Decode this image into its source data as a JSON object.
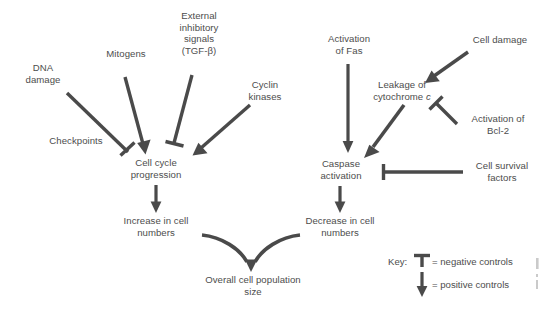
{
  "diagram": {
    "nodes": [
      {
        "id": "dna-damage",
        "label": "DNA\ndamage"
      },
      {
        "id": "mitogens",
        "label": "Mitogens"
      },
      {
        "id": "external-inhibitory",
        "label": "External\ninhibitory\nsignals\n(TGF-β)"
      },
      {
        "id": "cyclin-kinases",
        "label": "Cyclin\nkinases"
      },
      {
        "id": "checkpoints",
        "label": "Checkpoints"
      },
      {
        "id": "cell-cycle-progression",
        "label": "Cell cycle\nprogression"
      },
      {
        "id": "increase-in-cell-numbers",
        "label": "Increase in cell\nnumbers"
      },
      {
        "id": "overall-cell-population-size",
        "label": "Overall cell population\nsize"
      },
      {
        "id": "activation-of-fas",
        "label": "Activation\nof Fas"
      },
      {
        "id": "cell-damage",
        "label": "Cell damage"
      },
      {
        "id": "leakage-of-cytochrome-c",
        "label": "Leakage of\ncytochrome "
      },
      {
        "id": "leakage-cytochrome-italic",
        "label": "c"
      },
      {
        "id": "activation-of-bcl2",
        "label": "Activation of\nBcl-2"
      },
      {
        "id": "caspase-activation",
        "label": "Caspase\nactivation"
      },
      {
        "id": "cell-survival-factors",
        "label": "Cell survival\nfactors"
      },
      {
        "id": "decrease-in-cell-numbers",
        "label": "Decrease in cell\nnumbers"
      }
    ],
    "edges": [
      {
        "id": "dna-damage-to-cell-cycle",
        "from": "dna-damage",
        "to": "cell-cycle-progression",
        "type": "negative"
      },
      {
        "id": "mitogens-to-cell-cycle",
        "from": "mitogens",
        "to": "cell-cycle-progression",
        "type": "positive"
      },
      {
        "id": "tgfbeta-to-cell-cycle",
        "from": "external-inhibitory",
        "to": "cell-cycle-progression",
        "type": "negative"
      },
      {
        "id": "cyclin-kinases-to-cell-cycle",
        "from": "cyclin-kinases",
        "to": "cell-cycle-progression",
        "type": "positive"
      },
      {
        "id": "cell-cycle-to-increase",
        "from": "cell-cycle-progression",
        "to": "increase-in-cell-numbers",
        "type": "positive"
      },
      {
        "id": "increase-to-overall",
        "from": "increase-in-cell-numbers",
        "to": "overall-cell-population-size",
        "type": "positive"
      },
      {
        "id": "decrease-to-overall",
        "from": "decrease-in-cell-numbers",
        "to": "overall-cell-population-size",
        "type": "positive"
      },
      {
        "id": "fas-to-caspase",
        "from": "activation-of-fas",
        "to": "caspase-activation",
        "type": "positive"
      },
      {
        "id": "cell-damage-to-leakage",
        "from": "cell-damage",
        "to": "leakage-of-cytochrome-c",
        "type": "positive"
      },
      {
        "id": "leakage-to-caspase",
        "from": "leakage-of-cytochrome-c",
        "to": "caspase-activation",
        "type": "positive"
      },
      {
        "id": "bcl2-to-leakage",
        "from": "activation-of-bcl2",
        "to": "leakage-of-cytochrome-c",
        "type": "negative"
      },
      {
        "id": "survival-factors-to-caspase",
        "from": "cell-survival-factors",
        "to": "caspase-activation",
        "type": "negative"
      },
      {
        "id": "caspase-to-decrease",
        "from": "caspase-activation",
        "to": "decrease-in-cell-numbers",
        "type": "positive"
      }
    ],
    "key": {
      "title": "Key:",
      "entries": [
        {
          "id": "negative-controls",
          "symbol": "t-bar-icon",
          "label": "= negative controls"
        },
        {
          "id": "positive-controls",
          "symbol": "arrow-icon",
          "label": "= positive controls"
        }
      ]
    },
    "colors": {
      "stroke": "#4a4a4a",
      "text": "#4d4d4d",
      "background": "#ffffff"
    }
  }
}
